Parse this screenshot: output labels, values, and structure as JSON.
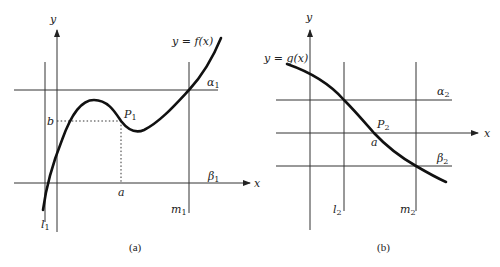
{
  "figure": {
    "panels": [
      {
        "id": "a",
        "caption": "(a)",
        "function_label": "y = f(x)",
        "axis_labels": {
          "x": "x",
          "y": "y"
        },
        "point": {
          "name": "P",
          "sub": "1"
        },
        "x_value_label": "a",
        "y_value_label": "b",
        "horizontal_lines": [
          {
            "name": "α",
            "sub": "1",
            "position": "above"
          },
          {
            "name": "β",
            "sub": "1",
            "position": "x-axis"
          }
        ],
        "vertical_lines": [
          {
            "name": "l",
            "sub": "1"
          },
          {
            "name": "m",
            "sub": "1"
          }
        ]
      },
      {
        "id": "b",
        "caption": "(b)",
        "function_label": "y = g(x)",
        "axis_labels": {
          "x": "x",
          "y": "y"
        },
        "point": {
          "name": "P",
          "sub": "2"
        },
        "x_value_label": "a",
        "horizontal_lines": [
          {
            "name": "α",
            "sub": "2",
            "position": "above"
          },
          {
            "name": "β",
            "sub": "2",
            "position": "below"
          }
        ],
        "vertical_lines": [
          {
            "name": "l",
            "sub": "2"
          },
          {
            "name": "m",
            "sub": "2"
          }
        ]
      }
    ],
    "colors": {
      "ink": "#111111",
      "background": "#ffffff"
    }
  }
}
